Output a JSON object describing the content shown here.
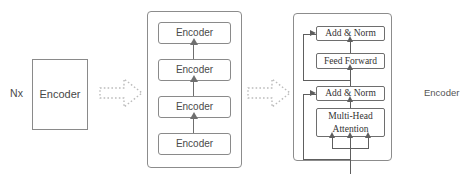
{
  "diagram": {
    "left": {
      "multiplier_label": "Nx",
      "encoder_label": "Encoder"
    },
    "connector_1": {
      "icon": "dotted-block-arrow-right",
      "direction": "right"
    },
    "stack": {
      "boxes": [
        {
          "label": "Encoder"
        },
        {
          "label": "Encoder"
        },
        {
          "label": "Encoder"
        },
        {
          "label": "Encoder"
        }
      ]
    },
    "connector_2": {
      "icon": "dotted-block-arrow-right",
      "direction": "right"
    },
    "block": {
      "add_norm_upper": "Add & Norm",
      "feed_forward": "Feed Forward",
      "add_norm_lower": "Add & Norm",
      "attention_line_1": "Multi-Head",
      "attention_line_2": "Attention"
    },
    "right_caption": "Encoder",
    "colors": {
      "line": "#6f6f6f",
      "box_border": "#8a8a8a",
      "text": "#3b3b3b",
      "background": "#ffffff",
      "dotted_arrow": "#b9b9b9"
    }
  }
}
